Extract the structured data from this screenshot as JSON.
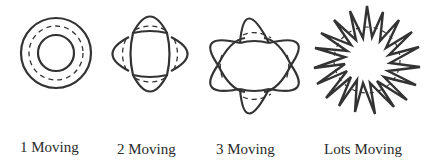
{
  "colors": {
    "stroke": "#333333",
    "background": "#ffffff"
  },
  "figures": [
    {
      "name": "1-moving",
      "label": "1 Moving"
    },
    {
      "name": "2-moving",
      "label": "2 Moving"
    },
    {
      "name": "3-moving",
      "label": "3 Moving"
    },
    {
      "name": "lots-moving",
      "label": "Lots Moving"
    }
  ]
}
